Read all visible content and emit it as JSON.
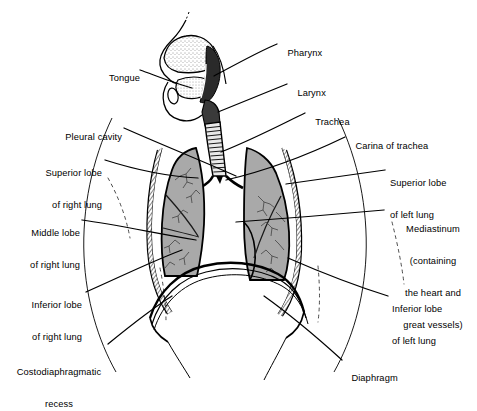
{
  "figure": {
    "background_color": "#ffffff",
    "ink_color": "#000000",
    "lung_fill_color": "#a9a9a9",
    "pleura_fill_color": "#ffffff"
  },
  "labels": [
    {
      "id": "tongue",
      "text": "Tongue",
      "align": "right"
    },
    {
      "id": "pharynx",
      "text": "Pharynx",
      "align": "left"
    },
    {
      "id": "larynx",
      "text": "Larynx",
      "align": "left"
    },
    {
      "id": "trachea",
      "text": "Trachea",
      "align": "left"
    },
    {
      "id": "carina",
      "text": "Carina of trachea",
      "align": "left"
    },
    {
      "id": "pleural-cavity",
      "text": "Pleural cavity",
      "align": "right"
    },
    {
      "id": "superior-right",
      "line1": "Superior lobe",
      "line2": "of right lung",
      "align": "right"
    },
    {
      "id": "middle-right",
      "line1": "Middle lobe",
      "line2": "of right lung",
      "align": "right"
    },
    {
      "id": "inferior-right",
      "line1": "Inferior lobe",
      "line2": "of right lung",
      "align": "right"
    },
    {
      "id": "costodiaphragmatic",
      "line1": "Costodiaphragmatic",
      "line2": "recess",
      "align": "center"
    },
    {
      "id": "superior-left",
      "line1": "Superior lobe",
      "line2": "of left lung",
      "align": "left"
    },
    {
      "id": "mediastinum",
      "line1": "Mediastinum",
      "line2": "(containing",
      "line3": "the heart and",
      "line4": "great vessels)",
      "align": "center"
    },
    {
      "id": "inferior-left",
      "line1": "Inferior lobe",
      "line2": "of left lung",
      "align": "left"
    },
    {
      "id": "diaphragm",
      "text": "Diaphragm",
      "align": "left"
    }
  ]
}
